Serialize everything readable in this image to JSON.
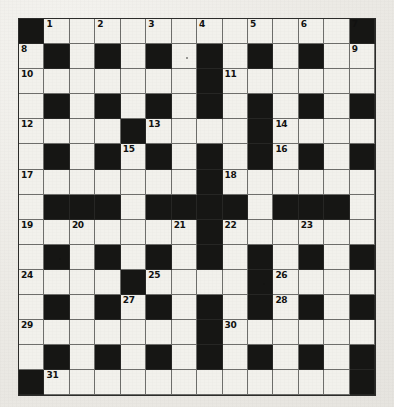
{
  "puzzle": {
    "title": "Crossword Grid",
    "type": "crossword",
    "columns": 14,
    "rows": 15,
    "colors": {
      "page_background": "#efeeea",
      "white_cell": "#f2f1ec",
      "black_cell": "#161614",
      "grid_line": "#6e6e6b",
      "border": "#2c2c2a",
      "number_text": "#111110"
    },
    "legend": {
      "W": "white-cell",
      "B": "black-cell"
    },
    "grid": [
      "BWWWWWWWWWWWWB",
      "WBWBWBWBWBWBWW",
      "WWWWWWWBWWWWWW",
      "WBWBWBWBWBWBWB",
      "WWWWBWWWWBWWWW",
      "WBWBWBWBWBWBWB",
      "WWWWWWWBWWWWWW",
      "WBBBWBBBBWBBBW",
      "WWWWWWWBWWWWWW",
      "WBWBWBWBWBWBWB",
      "WWWWBWWWWBWWWW",
      "WBWBWBWBWBWBWB",
      "WWWWWWWBWWWWWW",
      "WBWBWBWBWBWBWB",
      "BWWWWWWWWWWWWB"
    ],
    "clue_numbers": [
      {
        "n": "1",
        "row": 0,
        "col": 1
      },
      {
        "n": "2",
        "row": 0,
        "col": 3
      },
      {
        "n": "3",
        "row": 0,
        "col": 5
      },
      {
        "n": "4",
        "row": 0,
        "col": 7
      },
      {
        "n": "5",
        "row": 0,
        "col": 9
      },
      {
        "n": "6",
        "row": 0,
        "col": 11
      },
      {
        "n": "7",
        "row": 0,
        "col": 13
      },
      {
        "n": "8",
        "row": 1,
        "col": 0
      },
      {
        "n": "9",
        "row": 1,
        "col": 13
      },
      {
        "n": "10",
        "row": 2,
        "col": 0
      },
      {
        "n": "11",
        "row": 2,
        "col": 8
      },
      {
        "n": "12",
        "row": 4,
        "col": 0
      },
      {
        "n": "13",
        "row": 4,
        "col": 5
      },
      {
        "n": "14",
        "row": 4,
        "col": 10
      },
      {
        "n": "15",
        "row": 5,
        "col": 4
      },
      {
        "n": "16",
        "row": 5,
        "col": 10
      },
      {
        "n": "17",
        "row": 6,
        "col": 0
      },
      {
        "n": "18",
        "row": 6,
        "col": 8
      },
      {
        "n": "19",
        "row": 8,
        "col": 0
      },
      {
        "n": "20",
        "row": 8,
        "col": 2
      },
      {
        "n": "21",
        "row": 8,
        "col": 6
      },
      {
        "n": "22",
        "row": 8,
        "col": 8
      },
      {
        "n": "23",
        "row": 8,
        "col": 11
      },
      {
        "n": "24",
        "row": 10,
        "col": 0
      },
      {
        "n": "25",
        "row": 10,
        "col": 5
      },
      {
        "n": "26",
        "row": 10,
        "col": 10
      },
      {
        "n": "27",
        "row": 11,
        "col": 4
      },
      {
        "n": "28",
        "row": 11,
        "col": 10
      },
      {
        "n": "29",
        "row": 12,
        "col": 0
      },
      {
        "n": "30",
        "row": 12,
        "col": 8
      },
      {
        "n": "31",
        "row": 14,
        "col": 1
      }
    ],
    "ink_specks": [
      {
        "row": 1,
        "col": 6
      },
      {
        "row": 9,
        "col": 1
      },
      {
        "row": 10,
        "col": 9
      }
    ],
    "entries": {
      "values": []
    }
  }
}
